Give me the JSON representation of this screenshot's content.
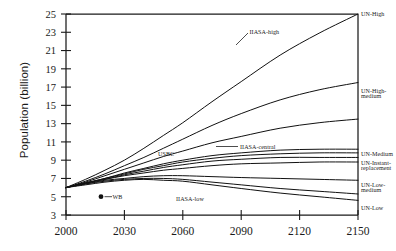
{
  "chart_data": {
    "type": "line",
    "title": "",
    "subtitle": "",
    "xlabel": "",
    "ylabel": "Population (billion)",
    "xlim": [
      2000,
      2150
    ],
    "ylim": [
      3,
      25
    ],
    "xticks": [
      2000,
      2030,
      2060,
      2090,
      2120,
      2150
    ],
    "xtick_labels": [
      "2000",
      "2030",
      "2060",
      "2090",
      "2120",
      "2150"
    ],
    "yticks": [
      3,
      5,
      7,
      9,
      11,
      13,
      15,
      17,
      19,
      21,
      23,
      25
    ],
    "ytick_labels": [
      "3",
      "5",
      "7",
      "9",
      "11",
      "13",
      "15",
      "17",
      "19",
      "21",
      "23",
      "25"
    ],
    "grid": false,
    "legend_position": "inline-right-and-annotations",
    "x": [
      2000,
      2010,
      2020,
      2030,
      2040,
      2050,
      2060,
      2075,
      2090,
      2110,
      2130,
      2150
    ],
    "series": [
      {
        "name": "UN-High",
        "label": "UN-High",
        "label_side": "right",
        "values": [
          6.0,
          6.9,
          7.9,
          9.0,
          10.3,
          11.7,
          13.1,
          15.4,
          17.6,
          20.5,
          22.9,
          25.0
        ]
      },
      {
        "name": "IIASA-high",
        "label": "IIASA-high",
        "label_side": "inline",
        "values": [
          6.0,
          6.7,
          7.5,
          8.4,
          9.3,
          10.3,
          11.3,
          12.8,
          14.1,
          15.6,
          16.7,
          17.5
        ]
      },
      {
        "name": "UN-High-medium",
        "label": "UN-High-medium",
        "label_side": "right",
        "values": [
          6.0,
          6.6,
          7.3,
          8.0,
          8.7,
          9.4,
          10.0,
          10.9,
          11.6,
          12.5,
          13.1,
          13.5
        ]
      },
      {
        "name": "IIASA-central",
        "label": "IIASA-central",
        "label_side": "inline",
        "values": [
          6.0,
          6.5,
          7.0,
          7.6,
          8.1,
          8.6,
          9.0,
          9.5,
          9.8,
          10.1,
          10.2,
          10.2
        ]
      },
      {
        "name": "USBC",
        "label": "USBC",
        "label_side": "inline",
        "values": [
          6.0,
          6.5,
          7.0,
          7.5,
          8.0,
          8.4,
          8.8,
          9.2,
          9.5,
          9.7,
          9.8,
          9.8
        ]
      },
      {
        "name": "UN-Medium",
        "label": "UN-Medium",
        "label_side": "right",
        "values": [
          6.0,
          6.5,
          6.9,
          7.4,
          7.8,
          8.2,
          8.5,
          8.9,
          9.1,
          9.3,
          9.3,
          9.3
        ]
      },
      {
        "name": "UN-Instant-replacement",
        "label": "UN-Instant-replacement",
        "label_side": "right",
        "values": [
          6.0,
          6.5,
          6.9,
          7.3,
          7.6,
          7.9,
          8.1,
          8.4,
          8.6,
          8.7,
          8.8,
          8.8
        ]
      },
      {
        "name": "UN-Low-medium",
        "label": "UN-Low-medium",
        "label_side": "right",
        "values": [
          6.0,
          6.4,
          6.8,
          7.0,
          7.2,
          7.3,
          7.3,
          7.2,
          7.1,
          7.0,
          6.9,
          6.8
        ]
      },
      {
        "name": "IIASA-low",
        "label": "IIASA-low",
        "label_side": "inline",
        "values": [
          6.0,
          6.4,
          6.7,
          6.9,
          7.0,
          7.0,
          6.9,
          6.6,
          6.3,
          5.9,
          5.6,
          5.3
        ]
      },
      {
        "name": "UN-Low",
        "label": "UN-Low",
        "label_side": "right",
        "values": [
          6.0,
          6.3,
          6.6,
          6.8,
          6.9,
          6.8,
          6.7,
          6.3,
          5.9,
          5.4,
          5.0,
          4.6
        ]
      }
    ],
    "annotations": [
      {
        "name": "wb-legend",
        "label": "WB",
        "marker": "filled-circle",
        "x": 2018,
        "y": 5.0
      }
    ]
  }
}
